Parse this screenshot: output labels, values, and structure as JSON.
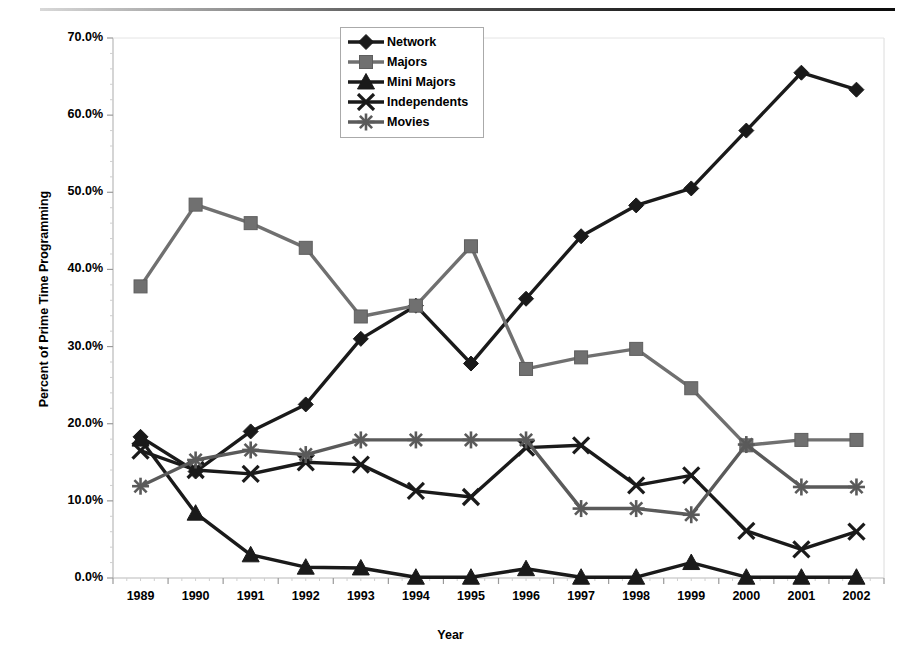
{
  "chart_data": {
    "type": "line",
    "title": "",
    "xlabel": "Year",
    "ylabel": "Percent of Prime Time Programming",
    "categories": [
      "1989",
      "1990",
      "1991",
      "1992",
      "1993",
      "1994",
      "1995",
      "1996",
      "1997",
      "1998",
      "1999",
      "2000",
      "2001",
      "2002"
    ],
    "ylim": [
      0,
      70
    ],
    "ytick_labels": [
      "0.0%",
      "10.0%",
      "20.0%",
      "30.0%",
      "40.0%",
      "50.0%",
      "60.0%",
      "70.0%"
    ],
    "ytick_values": [
      0,
      10,
      20,
      30,
      40,
      50,
      60,
      70
    ],
    "grid": false,
    "legend_position": "top-center",
    "series": [
      {
        "name": "Network",
        "marker": "diamond",
        "color": "#1a1a1a",
        "values": [
          18.3,
          13.8,
          19.0,
          22.5,
          31.0,
          35.3,
          27.8,
          36.2,
          44.3,
          48.3,
          50.5,
          58.0,
          65.5,
          63.3
        ]
      },
      {
        "name": "Majors",
        "marker": "square",
        "color": "#707070",
        "values": [
          37.8,
          48.4,
          46.0,
          42.8,
          33.9,
          35.3,
          43.0,
          27.1,
          28.6,
          29.7,
          24.6,
          17.2,
          17.9,
          17.9
        ]
      },
      {
        "name": "Mini Majors",
        "marker": "triangle",
        "color": "#1a1a1a",
        "values": [
          18.0,
          8.4,
          3.0,
          1.4,
          1.3,
          0.1,
          0.1,
          1.2,
          0.1,
          0.1,
          2.0,
          0.1,
          0.1,
          0.1
        ]
      },
      {
        "name": "Independents",
        "marker": "x",
        "color": "#1a1a1a",
        "values": [
          16.5,
          14.0,
          13.5,
          15.0,
          14.7,
          11.3,
          10.5,
          16.9,
          17.2,
          12.0,
          13.3,
          6.1,
          3.7,
          6.0
        ]
      },
      {
        "name": "Movies",
        "marker": "asterisk",
        "color": "#5a5a5a",
        "values": [
          11.9,
          15.3,
          16.6,
          16.0,
          17.9,
          17.9,
          17.9,
          17.9,
          9.0,
          9.0,
          8.2,
          17.3,
          11.8,
          11.8
        ]
      }
    ]
  }
}
